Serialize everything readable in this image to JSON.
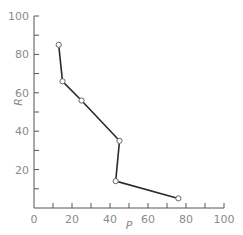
{
  "chart_data": {
    "type": "line",
    "title": "",
    "xlabel": "P",
    "ylabel": "R",
    "xlim": [
      0,
      100
    ],
    "ylim": [
      0,
      100
    ],
    "xticks": [
      0,
      20,
      40,
      60,
      80,
      100
    ],
    "yticks": [
      20,
      40,
      60,
      80,
      100
    ],
    "grid": false,
    "legend": null,
    "series": [
      {
        "name": "R vs P",
        "x": [
          13,
          15,
          25,
          45,
          43,
          76
        ],
        "y": [
          85,
          66,
          56,
          35,
          14,
          5
        ],
        "marker": "open-circle"
      }
    ]
  },
  "labels": {
    "xlabel": "P",
    "ylabel": "R",
    "xtick_labels": [
      "0",
      "20",
      "40",
      "60",
      "80",
      "100"
    ],
    "ytick_labels": [
      "20",
      "40",
      "60",
      "80",
      "100"
    ]
  }
}
